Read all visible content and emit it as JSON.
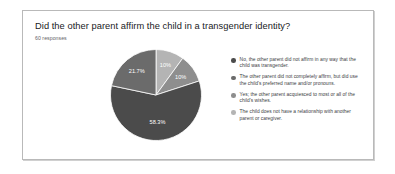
{
  "card": {
    "title": "Did the other parent affirm the child in a transgender identity?",
    "responses": "60 responses"
  },
  "chart_data": {
    "type": "pie",
    "title": "Did the other parent affirm the child in a transgender identity?",
    "subtitle": "60 responses",
    "legend_position": "right",
    "grid": false,
    "categories": [
      "No, the other parent did not affirm in any way that the child was transgender.",
      "The other parent did not completely affirm, but did use the child's preferred name and/or pronouns.",
      "Yes; the other parent acquiesced to most or all of the child's wishes.",
      "The child does not have a relationship with another parent or caregiver."
    ],
    "values": [
      58.3,
      21.7,
      10,
      10
    ],
    "value_labels": [
      "58.3%",
      "21.7%",
      "10%",
      "10%"
    ],
    "unit": "percent",
    "colors": [
      "#4b4b4b",
      "#6b6b6b",
      "#8e8e8e",
      "#b4b4b4"
    ],
    "slices": [
      {
        "label": "10%",
        "value": 10,
        "color": "#b4b4b4"
      },
      {
        "label": "10%",
        "value": 10,
        "color": "#8e8e8e"
      },
      {
        "label": "58.3%",
        "value": 58.3,
        "color": "#4b4b4b"
      },
      {
        "label": "21.7%",
        "value": 21.7,
        "color": "#6b6b6b"
      }
    ]
  },
  "legend": {
    "items": [
      {
        "color": "#4b4b4b",
        "label": "No, the other parent did not affirm in any way that the child was transgender."
      },
      {
        "color": "#6b6b6b",
        "label": "The other parent did not completely affirm, but did use the child's preferred name and/or pronouns."
      },
      {
        "color": "#8e8e8e",
        "label": "Yes; the other parent acquiesced to most or all of the child's wishes."
      },
      {
        "color": "#b4b4b4",
        "label": "The child does not have a relationship with another parent or caregiver."
      }
    ]
  }
}
